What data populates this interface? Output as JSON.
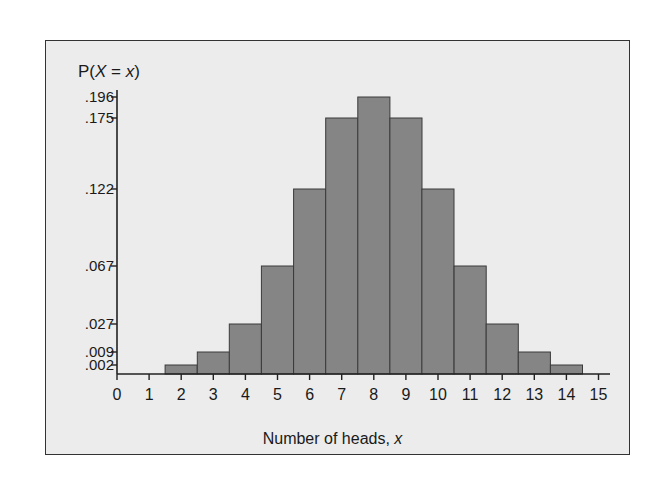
{
  "chart_data": {
    "type": "bar",
    "title": "",
    "ylabel": "P(X = x)",
    "xlabel": "Number of heads, x",
    "x": [
      0,
      1,
      2,
      3,
      4,
      5,
      6,
      7,
      8,
      9,
      10,
      11,
      12,
      13,
      14,
      15
    ],
    "categories": [
      "0",
      "1",
      "2",
      "3",
      "4",
      "5",
      "6",
      "7",
      "8",
      "9",
      "10",
      "11",
      "12",
      "13",
      "14",
      "15"
    ],
    "values": [
      0.0,
      0.0,
      0.002,
      0.009,
      0.027,
      0.067,
      0.122,
      0.175,
      0.196,
      0.175,
      0.122,
      0.067,
      0.027,
      0.009,
      0.002,
      0.0
    ],
    "ytick_labels": [
      ".196",
      ".175",
      ".122",
      ".067",
      ".027",
      ".009",
      ".002"
    ],
    "ytick_values": [
      0.196,
      0.175,
      0.122,
      0.067,
      0.027,
      0.009,
      0.002
    ],
    "xtick_labels": [
      "0",
      "1",
      "2",
      "3",
      "4",
      "5",
      "6",
      "7",
      "8",
      "9",
      "10",
      "11",
      "12",
      "13",
      "14",
      "15"
    ],
    "xlim": [
      0,
      15.5
    ],
    "ylim": [
      0,
      0.196
    ],
    "grid": false,
    "legend": null,
    "colors": {
      "bar_fill": "#858585",
      "bar_edge": "#3a3a3a",
      "background": "#ececec",
      "axis": "#222222"
    }
  },
  "labels": {
    "y_axis_prefix": "P(",
    "y_axis_var": "X",
    "y_axis_eq": " = ",
    "y_axis_x": "x",
    "y_axis_suffix": ")",
    "x_axis_text": "Number of heads, ",
    "x_axis_var": "x"
  },
  "ytick_pixel_y": {
    ".196": 97,
    ".175": 118,
    ".122": 189,
    ".067": 266,
    ".027": 324,
    ".009": 352,
    ".002": 365
  }
}
